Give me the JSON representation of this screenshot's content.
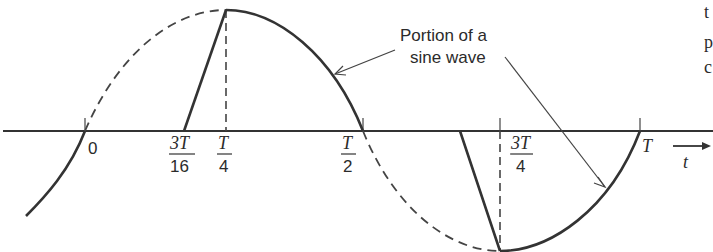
{
  "figure": {
    "annotation": {
      "line1": "Portion of a",
      "line2": "sine wave"
    },
    "axis": {
      "variable": "t",
      "ticks": [
        {
          "id": "zero",
          "num": "0",
          "den": ""
        },
        {
          "id": "3T16",
          "num": "3T",
          "den": "16"
        },
        {
          "id": "T4",
          "num": "T",
          "den": "4"
        },
        {
          "id": "T2",
          "num": "T",
          "den": "2"
        },
        {
          "id": "3T4",
          "num": "3T",
          "den": "4"
        },
        {
          "id": "T",
          "num": "T",
          "den": ""
        }
      ]
    },
    "margin_fragments": [
      "t",
      "p",
      "c"
    ],
    "colors": {
      "curve": "#333333",
      "axis": "#333333",
      "text": "#2b2b2b"
    }
  }
}
